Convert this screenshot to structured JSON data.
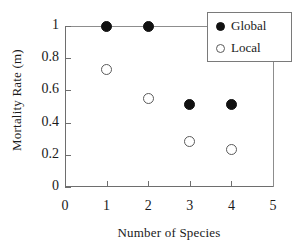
{
  "chart_data": {
    "type": "scatter",
    "title": "",
    "xlabel": "Number of Species",
    "ylabel": "Mortality Rate (m)",
    "xlim": [
      0,
      5
    ],
    "ylim": [
      0,
      1
    ],
    "xticks": [
      "0",
      "1",
      "2",
      "3",
      "4",
      "5"
    ],
    "yticks": [
      "0",
      "0.2",
      "0.4",
      "0.6",
      "0.8",
      "1"
    ],
    "grid": false,
    "legend_position": "top-right",
    "x": [
      1,
      2,
      3,
      4
    ],
    "series": [
      {
        "name": "Global",
        "marker": "filled-circle",
        "color": "#111111",
        "values": [
          1.0,
          1.0,
          0.51,
          0.51
        ]
      },
      {
        "name": "Local",
        "marker": "open-circle",
        "color": "#5a5a5a",
        "values": [
          0.73,
          0.55,
          0.28,
          0.23
        ]
      }
    ]
  },
  "legend": {
    "entries": [
      {
        "label": "Global",
        "marker": "filled-circle"
      },
      {
        "label": "Local",
        "marker": "open-circle"
      }
    ]
  }
}
